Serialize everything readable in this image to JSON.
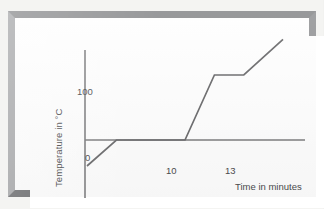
{
  "figure": {
    "kind": "printed-graph-photo",
    "frame_color": "#8d8e90",
    "plate_color": "#ffffff"
  },
  "chart_data": {
    "type": "line",
    "title": "",
    "subtitle": "",
    "xlabel": "Time in minutes",
    "ylabel": "Temperature in °C",
    "grid": false,
    "legend": null,
    "axis_color": "#7b7b7d",
    "line_color": "#6a6a6c",
    "xlim": [
      -2,
      22
    ],
    "ylim": [
      -60,
      170
    ],
    "x_ticks": [
      10,
      13
    ],
    "x_tick_labels": [
      "10",
      "13"
    ],
    "y_ticks": [
      0,
      100
    ],
    "y_tick_labels": [
      "0",
      "100"
    ],
    "series": [
      {
        "name": "Heating curve of water",
        "x": [
          0,
          3,
          10,
          13,
          16,
          20
        ],
        "y": [
          -40,
          0,
          0,
          100,
          100,
          155
        ],
        "points": [
          {
            "x": 0,
            "y": -40,
            "note": "start, ice below melting point"
          },
          {
            "x": 3,
            "y": 0,
            "note": "melting begins"
          },
          {
            "x": 10,
            "y": 0,
            "note": "melting ends"
          },
          {
            "x": 13,
            "y": 100,
            "note": "boiling begins"
          },
          {
            "x": 16,
            "y": 100,
            "note": "boiling plateau ends"
          },
          {
            "x": 20,
            "y": 155,
            "note": "end of recording"
          }
        ]
      }
    ],
    "annotations": []
  },
  "labels": {
    "y_axis_title": "Temperature in °C",
    "x_axis_title": "Time in minutes",
    "tick_100": "100",
    "tick_0": "0",
    "tick_10": "10",
    "tick_13": "13"
  }
}
